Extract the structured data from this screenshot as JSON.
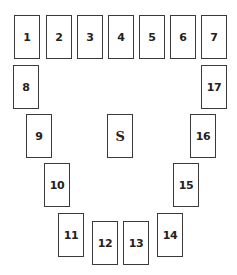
{
  "diagram": {
    "type": "fuse-box-layout",
    "slots": [
      {
        "label": "1"
      },
      {
        "label": "2"
      },
      {
        "label": "3"
      },
      {
        "label": "4"
      },
      {
        "label": "5"
      },
      {
        "label": "6"
      },
      {
        "label": "7"
      },
      {
        "label": "8"
      },
      {
        "label": "9"
      },
      {
        "label": "10"
      },
      {
        "label": "11"
      },
      {
        "label": "12"
      },
      {
        "label": "13"
      },
      {
        "label": "14"
      },
      {
        "label": "15"
      },
      {
        "label": "16"
      },
      {
        "label": "17"
      }
    ],
    "center_slot": {
      "label": "S"
    },
    "colors": {
      "border": "#3a3a3a",
      "text": "#222222",
      "background": "#ffffff"
    }
  }
}
